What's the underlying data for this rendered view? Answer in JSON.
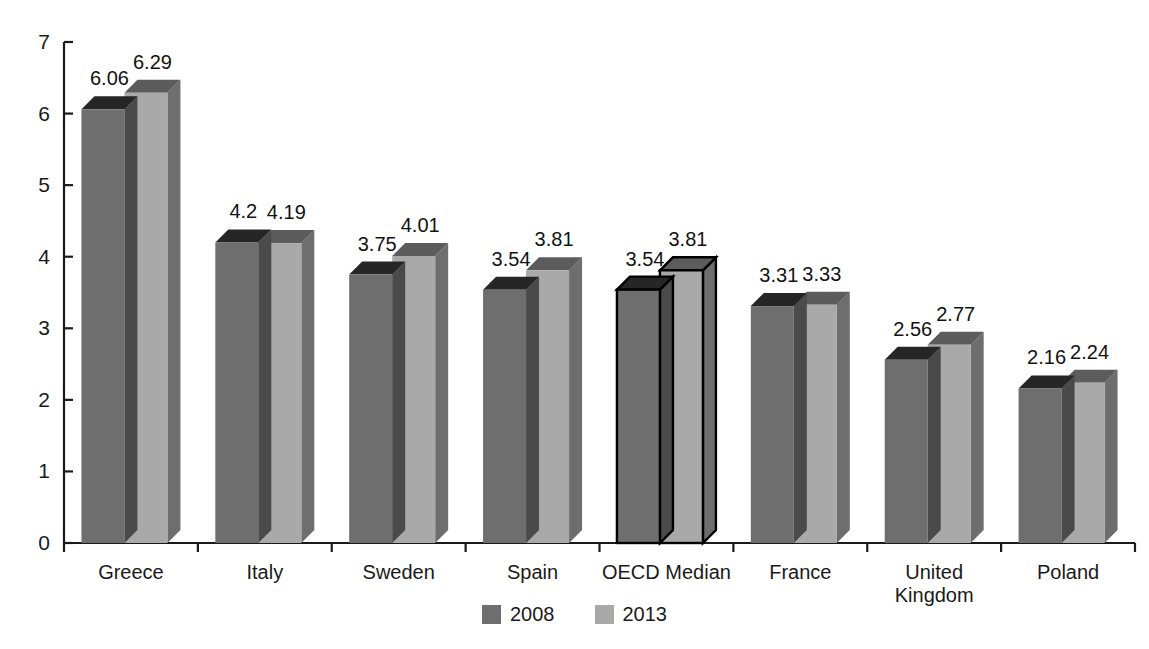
{
  "chart_data": {
    "type": "bar",
    "title": "",
    "subtitle": "",
    "xlabel": "",
    "ylabel": "",
    "categories": [
      "Greece",
      "Italy",
      "Sweden",
      "Spain",
      "OECD Median",
      "France",
      "United\nKingdom",
      "Poland"
    ],
    "series": [
      {
        "name": "2008",
        "color": "#6e6e6e",
        "values": [
          6.06,
          4.2,
          3.75,
          3.54,
          3.54,
          3.31,
          2.56,
          2.16
        ]
      },
      {
        "name": "2013",
        "color": "#a9a9a9",
        "values": [
          6.29,
          4.19,
          4.01,
          3.81,
          3.81,
          3.33,
          2.77,
          2.24
        ]
      }
    ],
    "value_labels": [
      [
        "6.06",
        "6.29"
      ],
      [
        "4.2",
        "4.19"
      ],
      [
        "3.75",
        "4.01"
      ],
      [
        "3.54",
        "3.81"
      ],
      [
        "3.54",
        "3.81"
      ],
      [
        "3.31",
        "3.33"
      ],
      [
        "2.56",
        "2.77"
      ],
      [
        "2.16",
        "2.24"
      ]
    ],
    "highlighted_category": "OECD Median",
    "ylim": [
      0,
      7
    ],
    "yticks": [
      0,
      1,
      2,
      3,
      4,
      5,
      6,
      7
    ],
    "ytick_labels": [
      "0",
      "1",
      "2",
      "3",
      "4",
      "5",
      "6",
      "7"
    ],
    "grid": false,
    "legend_position": "bottom",
    "style": "3d-column"
  },
  "axes": {
    "y_tick_labels": [
      "7",
      "6",
      "5",
      "4",
      "3",
      "2",
      "1",
      "0"
    ],
    "x_category_labels": [
      "Greece",
      "Italy",
      "Sweden",
      "Spain",
      "OECD Median",
      "France",
      "United\nKingdom",
      "Poland"
    ]
  },
  "legend": {
    "items": [
      {
        "label": "2008",
        "color": "#6e6e6e"
      },
      {
        "label": "2013",
        "color": "#a9a9a9"
      }
    ]
  },
  "colors": {
    "series_2008_front": "#6e6e6e",
    "series_2008_top": "#262626",
    "series_2008_side": "#4a4a4a",
    "series_2013_front": "#a9a9a9",
    "series_2013_top": "#5c5c5c",
    "series_2013_side": "#6e6e6e",
    "axis": "#1a1a1a",
    "highlight_outline": "#000000",
    "background": "#ffffff"
  }
}
